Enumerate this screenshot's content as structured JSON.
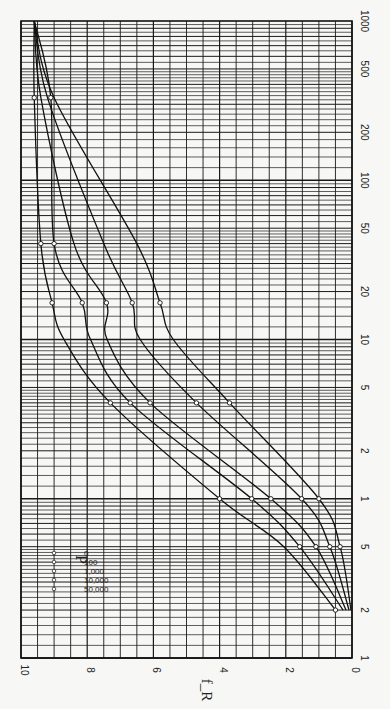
{
  "chart_data": {
    "type": "line",
    "orientation_note": "figure printed rotated 90 degrees clockwise",
    "title": "",
    "xlabel": "",
    "ylabel": "f_R",
    "x_scale": "log",
    "xlim": [
      0.1,
      1000
    ],
    "ylim": [
      0,
      10
    ],
    "grid": true,
    "x_tick_labels": [
      {
        "value": 0.1,
        "label": "1"
      },
      {
        "value": 0.2,
        "label": "2"
      },
      {
        "value": 0.5,
        "label": "5"
      },
      {
        "value": 1,
        "label": "1"
      },
      {
        "value": 2,
        "label": "2"
      },
      {
        "value": 5,
        "label": "5"
      },
      {
        "value": 10,
        "label": "10"
      },
      {
        "value": 20,
        "label": "20"
      },
      {
        "value": 50,
        "label": "50"
      },
      {
        "value": 100,
        "label": "100"
      },
      {
        "value": 200,
        "label": "200"
      },
      {
        "value": 500,
        "label": "500"
      },
      {
        "value": 1000,
        "label": "1000"
      }
    ],
    "y_tick_labels": [
      {
        "value": 0,
        "label": "0"
      },
      {
        "value": 2,
        "label": "2"
      },
      {
        "value": 4,
        "label": "4"
      },
      {
        "value": 6,
        "label": "6"
      },
      {
        "value": 8,
        "label": "8"
      },
      {
        "value": 10,
        "label": "10"
      }
    ],
    "legend": {
      "title": "P",
      "placement": "lower-left (rotated)",
      "entries": [
        {
          "label": "0",
          "marker": "circle"
        },
        {
          "label": "100",
          "marker": "circle"
        },
        {
          "label": "1,000",
          "marker": "triangle"
        },
        {
          "label": "10,000",
          "marker": "diamond"
        },
        {
          "label": "50,000",
          "marker": "triangle-down"
        }
      ]
    },
    "series": [
      {
        "name": "P = 0",
        "marker": "circle",
        "x": [
          0.2,
          0.5,
          1,
          4,
          10,
          17,
          40,
          330,
          1000
        ],
        "y": [
          0.5,
          2.06,
          4.0,
          7.3,
          8.7,
          9.06,
          9.4,
          9.6,
          9.6
        ],
        "marked_x": [
          0.2,
          1,
          4,
          17,
          40,
          330
        ]
      },
      {
        "name": "P = 100",
        "marker": "circle",
        "x": [
          0.2,
          0.5,
          1,
          4,
          10,
          17,
          40,
          330,
          1000
        ],
        "y": [
          0.27,
          1.58,
          3.03,
          6.7,
          7.9,
          8.15,
          9.0,
          9.1,
          9.6
        ],
        "marked_x": [
          0.5,
          1,
          4,
          17,
          40,
          330
        ]
      },
      {
        "name": "P = 1,000",
        "marker": "triangle",
        "x": [
          0.2,
          0.5,
          1,
          4,
          10,
          17,
          40,
          330,
          1000
        ],
        "y": [
          0.18,
          1.09,
          2.45,
          6.1,
          7.4,
          7.42,
          8.4,
          9.4,
          9.6
        ],
        "marked_x": [
          0.5,
          1,
          4,
          17
        ]
      },
      {
        "name": "P = 10,000",
        "marker": "diamond",
        "x": [
          0.2,
          0.5,
          1,
          4,
          10,
          17,
          40,
          330,
          1000
        ],
        "y": [
          0.09,
          0.67,
          1.52,
          4.7,
          6.4,
          6.64,
          7.5,
          9.2,
          9.6
        ],
        "marked_x": [
          0.5,
          1,
          4,
          17
        ]
      },
      {
        "name": "P = 50,000",
        "marker": "triangle-down",
        "x": [
          0.2,
          0.5,
          1,
          4,
          10,
          17,
          40,
          330,
          1000
        ],
        "y": [
          0.03,
          0.36,
          1.0,
          3.7,
          5.4,
          5.8,
          6.5,
          9.0,
          9.6
        ],
        "marked_x": [
          0.5,
          1,
          4,
          17
        ]
      }
    ]
  }
}
